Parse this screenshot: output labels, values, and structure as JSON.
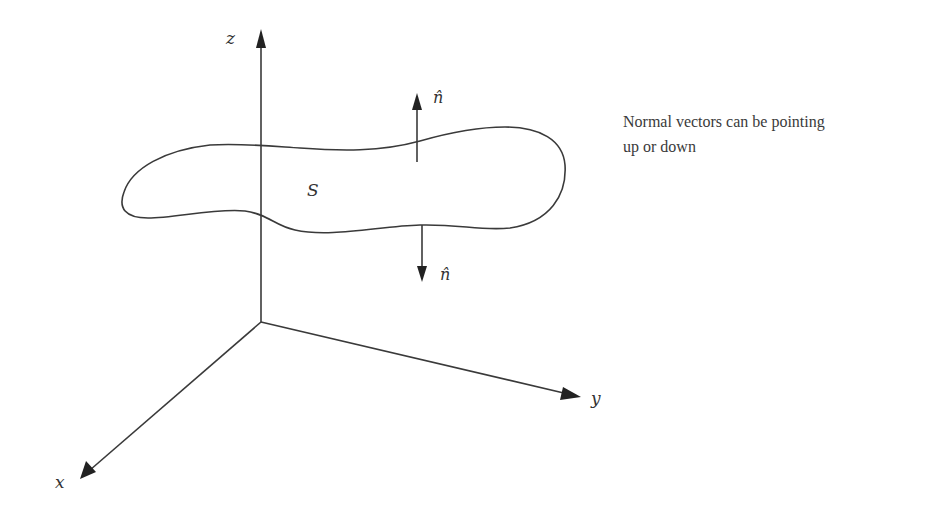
{
  "diagram": {
    "type": "3d-axes-surface-normals",
    "axes": {
      "z_label": "z",
      "y_label": "y",
      "x_label": "x"
    },
    "surface": {
      "label": "S"
    },
    "normals": {
      "up_label": "n̂",
      "down_label": "n̂"
    },
    "annotation": {
      "line1": "Normal vectors can be pointing",
      "line2": "up or down"
    },
    "colors": {
      "line": "#3a3a3a",
      "arrowhead": "#222222",
      "background": "#ffffff"
    }
  }
}
